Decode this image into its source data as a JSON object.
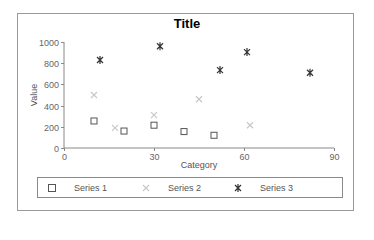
{
  "chart_data": {
    "type": "scatter",
    "title": "Title",
    "xlabel": "Category",
    "ylabel": "Value",
    "xlim": [
      0,
      90
    ],
    "ylim": [
      0,
      1000
    ],
    "xticks": [
      0,
      30,
      60,
      90
    ],
    "yticks": [
      0,
      200,
      400,
      600,
      800,
      1000
    ],
    "grid": false,
    "legend_position": "bottom",
    "series": [
      {
        "name": "Series 1",
        "marker": "square-open",
        "color": "#555555",
        "points": [
          [
            10,
            255
          ],
          [
            20,
            160
          ],
          [
            30,
            215
          ],
          [
            40,
            155
          ],
          [
            50,
            120
          ]
        ]
      },
      {
        "name": "Series 2",
        "marker": "x",
        "color": "#c8c8c8",
        "points": [
          [
            10,
            500
          ],
          [
            17,
            190
          ],
          [
            30,
            310
          ],
          [
            45,
            460
          ],
          [
            62,
            215
          ]
        ]
      },
      {
        "name": "Series 3",
        "marker": "asterisk",
        "color": "#333333",
        "points": [
          [
            12,
            830
          ],
          [
            32,
            960
          ],
          [
            52,
            735
          ],
          [
            61,
            905
          ],
          [
            82,
            710
          ]
        ]
      }
    ]
  },
  "labels": {
    "title": "Title",
    "xlabel": "Category",
    "ylabel": "Value",
    "legend": [
      "Series 1",
      "Series 2",
      "Series 3"
    ]
  }
}
